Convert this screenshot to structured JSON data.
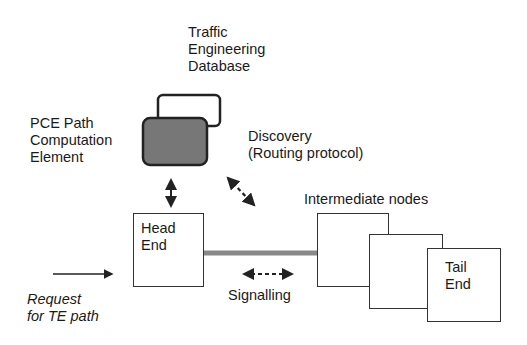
{
  "diagram": {
    "labels": {
      "ted": "Traffic\nEngineering\nDatabase",
      "pce": "PCE Path\nComputation\nElement",
      "discovery": "Discovery\n(Routing protocol)",
      "head_end": "Head\nEnd",
      "intermediate": "Intermediate nodes",
      "tail_end": "Tail\nEnd",
      "signalling": "Signalling",
      "request": "Request\nfor TE path"
    },
    "colors": {
      "pce_fill": "#777777",
      "line": "#222222",
      "link": "#888888"
    },
    "nodes": [
      {
        "id": "ted",
        "label": "Traffic Engineering Database",
        "shape": "rounded-rect",
        "fill": "white"
      },
      {
        "id": "pce",
        "label": "PCE Path Computation Element",
        "shape": "rounded-rect",
        "fill": "dark-grey"
      },
      {
        "id": "head_end",
        "label": "Head End",
        "shape": "rect"
      },
      {
        "id": "intermediate_1",
        "label": "",
        "shape": "rect"
      },
      {
        "id": "intermediate_2",
        "label": "",
        "shape": "rect"
      },
      {
        "id": "tail_end",
        "label": "Tail End",
        "shape": "rect"
      }
    ],
    "edges": [
      {
        "from": "pce",
        "to": "head_end",
        "style": "solid-bidirectional"
      },
      {
        "from": "discovery",
        "to": "intermediate",
        "style": "dashed-bidirectional"
      },
      {
        "from": "head_end",
        "to": "intermediate_1",
        "style": "thick-grey-link"
      },
      {
        "label": "Signalling",
        "style": "dashed-bidirectional"
      },
      {
        "label": "Request for TE path",
        "to": "head_end",
        "style": "solid-arrow"
      }
    ]
  }
}
